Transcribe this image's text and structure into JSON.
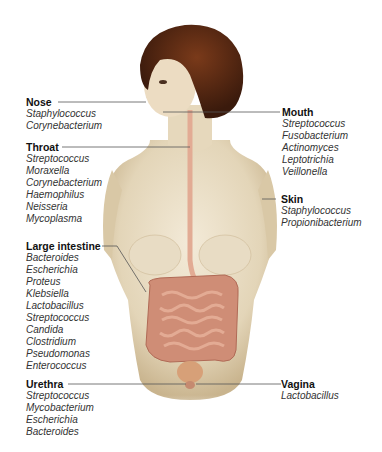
{
  "diagram": {
    "sites": [
      {
        "id": "nose",
        "title": "Nose",
        "organisms": [
          "Staphylococcus",
          "Corynebacterium"
        ]
      },
      {
        "id": "throat",
        "title": "Throat",
        "organisms": [
          "Streptococcus",
          "Moraxella",
          "Corynebacterium",
          "Haemophilus",
          "Neisseria",
          "Mycoplasma"
        ]
      },
      {
        "id": "large_intestine",
        "title": "Large intestine",
        "organisms": [
          "Bacteroides",
          "Escherichia",
          "Proteus",
          "Klebsiella",
          "Lactobacillus",
          "Streptococcus",
          "Candida",
          "Clostridium",
          "Pseudomonas",
          "Enterococcus"
        ]
      },
      {
        "id": "urethra",
        "title": "Urethra",
        "organisms": [
          "Streptococcus",
          "Mycobacterium",
          "Escherichia",
          "Bacteroides"
        ]
      },
      {
        "id": "mouth",
        "title": "Mouth",
        "organisms": [
          "Streptococcus",
          "Fusobacterium",
          "Actinomyces",
          "Leptotrichia",
          "Veillonella"
        ]
      },
      {
        "id": "skin",
        "title": "Skin",
        "organisms": [
          "Staphylococcus",
          "Propionibacterium"
        ]
      },
      {
        "id": "vagina",
        "title": "Vagina",
        "organisms": [
          "Lactobacillus"
        ]
      }
    ]
  },
  "colors": {
    "skin": "#e8dcc4",
    "skin_shadow": "#cbb996",
    "hair": "#5a2a14",
    "intestine": "#d4957e",
    "esophagus": "#e6b3a0",
    "leader_line": "#555555"
  }
}
